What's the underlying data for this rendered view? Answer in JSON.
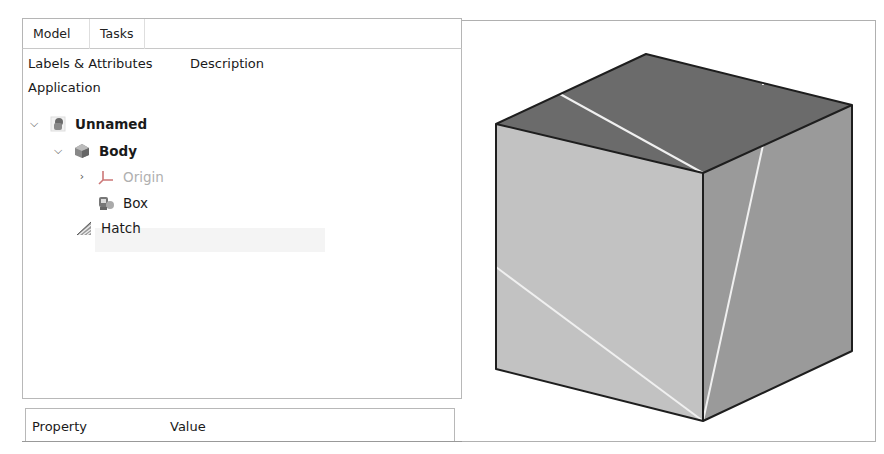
{
  "combo_view": {
    "tabs": [
      {
        "label": "Model",
        "active": true
      },
      {
        "label": "Tasks",
        "active": false
      }
    ],
    "tree": {
      "columns": [
        "Labels & Attributes",
        "Description"
      ],
      "root_label": "Application",
      "items": [
        {
          "label": "Unnamed",
          "icon": "document-icon",
          "expander": "expanded",
          "bold": true,
          "depth": 0
        },
        {
          "label": "Body",
          "icon": "body-icon",
          "expander": "expanded",
          "bold": true,
          "depth": 1
        },
        {
          "label": "Origin",
          "icon": "origin-axes-icon",
          "expander": "collapsed",
          "dimmed": true,
          "depth": 2
        },
        {
          "label": "Box",
          "icon": "box-feature-icon",
          "expander": "none",
          "depth": 2
        },
        {
          "label": "Hatch",
          "icon": "hatch-icon",
          "expander": "none",
          "highlighted": true,
          "depth": 1
        }
      ]
    },
    "property_view": {
      "columns": [
        "Property",
        "Value"
      ]
    }
  },
  "viewport": {
    "object": "cube",
    "colors": {
      "top_face": "#6b6b6b",
      "left_face": "#c2c2c2",
      "right_face": "#9a9a9a",
      "edges": "#1e1e1e",
      "hatch_lines": "#f0f0f0"
    }
  }
}
